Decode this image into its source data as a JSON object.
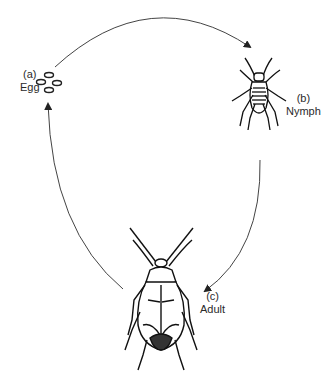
{
  "diagram": {
    "type": "life-cycle",
    "stages": [
      {
        "letter": "(a)",
        "name": "Egg"
      },
      {
        "letter": "(b)",
        "name": "Nymph"
      },
      {
        "letter": "(c)",
        "name": "Adult"
      }
    ],
    "arrows": [
      {
        "from": "Egg",
        "to": "Nymph"
      },
      {
        "from": "Nymph",
        "to": "Adult"
      },
      {
        "from": "Adult",
        "to": "Egg"
      }
    ],
    "colors": {
      "line": "#333333",
      "background": "#ffffff"
    }
  }
}
